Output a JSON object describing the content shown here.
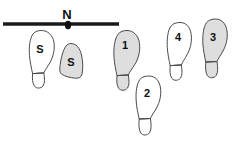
{
  "figure": {
    "name": "footprint-track-diagram",
    "background_color": "#ffffff",
    "outline_color": "#4a4a4a",
    "fill_shaded": "#dedede",
    "fill_plain": "#ffffff",
    "line_color": "#1a1a1a"
  },
  "reference_line": {
    "label": "N",
    "marker": "point-marker",
    "x_start": 3,
    "x_end": 119,
    "y": 24,
    "marker_x": 68,
    "marker_y": 24,
    "label_x": 67,
    "label_y": 14
  },
  "footprints": [
    {
      "id": "print-s-left",
      "label": "S",
      "shaded": false,
      "complete": true,
      "label_x": 40,
      "label_y": 50
    },
    {
      "id": "print-s-partial",
      "label": "S",
      "shaded": true,
      "complete": false,
      "label_x": 71,
      "label_y": 63
    },
    {
      "id": "print-1",
      "label": "1",
      "shaded": true,
      "complete": true,
      "label_x": 125,
      "label_y": 46
    },
    {
      "id": "print-2",
      "label": "2",
      "shaded": false,
      "complete": true,
      "label_x": 147,
      "label_y": 94
    },
    {
      "id": "print-4",
      "label": "4",
      "shaded": false,
      "complete": true,
      "label_x": 178,
      "label_y": 38
    },
    {
      "id": "print-3",
      "label": "3",
      "shaded": true,
      "complete": true,
      "label_x": 213,
      "label_y": 38
    }
  ]
}
